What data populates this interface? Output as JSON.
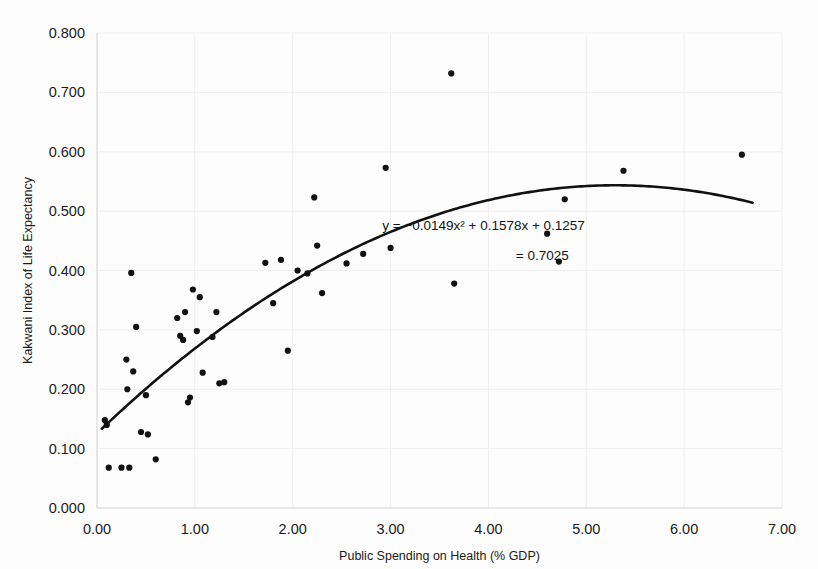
{
  "chart_data": {
    "type": "scatter",
    "title": "",
    "xlabel": "Public Spending on Health (% GDP)",
    "ylabel": "Kakwani Index of Life Expectancy",
    "xlim": [
      0.0,
      7.0
    ],
    "ylim": [
      0.0,
      0.8
    ],
    "xticks": [
      "0.00",
      "1.00",
      "2.00",
      "3.00",
      "4.00",
      "5.00",
      "6.00",
      "7.00"
    ],
    "xtick_values": [
      0.0,
      1.0,
      2.0,
      3.0,
      4.0,
      5.0,
      6.0,
      7.0
    ],
    "yticks": [
      "0.000",
      "0.100",
      "0.200",
      "0.300",
      "0.400",
      "0.500",
      "0.600",
      "0.700",
      "0.800"
    ],
    "ytick_values": [
      0.0,
      0.1,
      0.2,
      0.3,
      0.4,
      0.5,
      0.6,
      0.7,
      0.8
    ],
    "grid": true,
    "legend": false,
    "marker_color": "#111111",
    "trend_color": "#111111",
    "annotations": [
      {
        "name": "regression-equation",
        "text": "y = −0.0149x² + 0.1578x + 0.1257",
        "x": 3.95,
        "y": 0.468
      },
      {
        "name": "r-squared-value",
        "text": "= 0.7025",
        "x": 4.55,
        "y": 0.417
      }
    ],
    "trendline": {
      "kind": "quadratic",
      "equation": "y = -0.0149x^2 + 0.1578x + 0.1257",
      "a": -0.0149,
      "b": 0.1578,
      "c": 0.1257,
      "r_squared": 0.7025,
      "x_start": 0.05,
      "x_end": 6.7
    },
    "points": [
      [
        0.08,
        0.148
      ],
      [
        0.1,
        0.14
      ],
      [
        0.12,
        0.068
      ],
      [
        0.25,
        0.068
      ],
      [
        0.3,
        0.25
      ],
      [
        0.31,
        0.2
      ],
      [
        0.33,
        0.068
      ],
      [
        0.35,
        0.396
      ],
      [
        0.37,
        0.23
      ],
      [
        0.4,
        0.305
      ],
      [
        0.45,
        0.128
      ],
      [
        0.5,
        0.19
      ],
      [
        0.52,
        0.124
      ],
      [
        0.6,
        0.082
      ],
      [
        0.82,
        0.32
      ],
      [
        0.85,
        0.29
      ],
      [
        0.88,
        0.283
      ],
      [
        0.9,
        0.33
      ],
      [
        0.93,
        0.178
      ],
      [
        0.95,
        0.186
      ],
      [
        0.98,
        0.368
      ],
      [
        1.02,
        0.298
      ],
      [
        1.05,
        0.355
      ],
      [
        1.08,
        0.228
      ],
      [
        1.18,
        0.288
      ],
      [
        1.22,
        0.33
      ],
      [
        1.25,
        0.21
      ],
      [
        1.3,
        0.212
      ],
      [
        1.72,
        0.413
      ],
      [
        1.8,
        0.345
      ],
      [
        1.88,
        0.418
      ],
      [
        1.95,
        0.265
      ],
      [
        2.05,
        0.4
      ],
      [
        2.15,
        0.395
      ],
      [
        2.22,
        0.523
      ],
      [
        2.25,
        0.442
      ],
      [
        2.3,
        0.362
      ],
      [
        2.55,
        0.412
      ],
      [
        2.72,
        0.428
      ],
      [
        2.95,
        0.573
      ],
      [
        3.0,
        0.438
      ],
      [
        3.62,
        0.732
      ],
      [
        3.65,
        0.378
      ],
      [
        4.6,
        0.462
      ],
      [
        4.72,
        0.415
      ],
      [
        4.78,
        0.52
      ],
      [
        5.38,
        0.568
      ],
      [
        6.59,
        0.595
      ]
    ]
  },
  "figure": {
    "axis_title_x": "Public Spending on Health (% GDP)",
    "axis_title_y": "Kakwani Index of Life Expectancy"
  }
}
